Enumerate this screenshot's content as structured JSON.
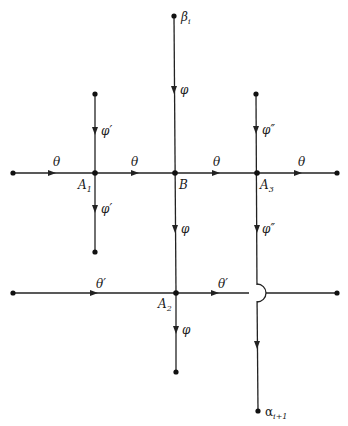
{
  "diagram": {
    "type": "directed-graph",
    "nodes": [
      {
        "id": "beta_i",
        "label": "β",
        "sub": "i",
        "x": 174,
        "y": 16,
        "lx": 181,
        "ly": 20
      },
      {
        "id": "top_A1",
        "label": "",
        "x": 95,
        "y": 94
      },
      {
        "id": "top_A3",
        "label": "",
        "x": 256,
        "y": 94
      },
      {
        "id": "left_row1",
        "label": "",
        "x": 13,
        "y": 173
      },
      {
        "id": "A1",
        "label": "A",
        "sub": "1",
        "x": 95,
        "y": 173,
        "lx": 78,
        "ly": 188
      },
      {
        "id": "B",
        "label": "B",
        "sub": "",
        "x": 175,
        "y": 173,
        "lx": 179,
        "ly": 188
      },
      {
        "id": "A3",
        "label": "A",
        "sub": "3",
        "x": 257,
        "y": 173,
        "lx": 260,
        "ly": 188
      },
      {
        "id": "right_row1",
        "label": "",
        "x": 337,
        "y": 173
      },
      {
        "id": "bottom_A1",
        "label": "",
        "x": 95,
        "y": 252
      },
      {
        "id": "left_row2",
        "label": "",
        "x": 13,
        "y": 293
      },
      {
        "id": "A2",
        "label": "A",
        "sub": "2",
        "x": 176,
        "y": 293,
        "lx": 158,
        "ly": 307
      },
      {
        "id": "right_row2",
        "label": "",
        "x": 337,
        "y": 293
      },
      {
        "id": "bottom_A2",
        "label": "",
        "x": 176,
        "y": 372
      },
      {
        "id": "alpha_i1",
        "label": "α",
        "sub": "i+1",
        "x": 258,
        "y": 411,
        "lx": 265,
        "ly": 415
      }
    ],
    "edges": [
      {
        "from": "beta_i",
        "to": "B",
        "label": "φ",
        "ax": 174,
        "ay": 90,
        "dir": "down"
      },
      {
        "from": "top_A1",
        "to": "A1",
        "label": "φ′",
        "ax": 95,
        "ay": 131,
        "dir": "down"
      },
      {
        "from": "A1",
        "to": "bottom_A1",
        "label": "φ′",
        "ax": 95,
        "ay": 209,
        "dir": "down"
      },
      {
        "from": "top_A3",
        "to": "A3",
        "label": "φ″",
        "ax": 256,
        "ay": 130,
        "dir": "down"
      },
      {
        "from": "A3",
        "to": "alpha_i1",
        "label": "φ″",
        "ax": 257,
        "ay": 229,
        "dir": "down"
      },
      {
        "from": "B",
        "to": "A2",
        "label": "φ",
        "ax": 175,
        "ay": 229,
        "dir": "down"
      },
      {
        "from": "A2",
        "to": "bottom_A2",
        "label": "φ",
        "ax": 176,
        "ay": 330,
        "dir": "down"
      },
      {
        "from": "left_row1",
        "to": "A1",
        "label": "θ",
        "ax": 52,
        "ay": 173,
        "dir": "right"
      },
      {
        "from": "A1",
        "to": "B",
        "label": "θ",
        "ax": 135,
        "ay": 173,
        "dir": "right"
      },
      {
        "from": "B",
        "to": "A3",
        "label": "θ",
        "ax": 216,
        "ay": 173,
        "dir": "right"
      },
      {
        "from": "A3",
        "to": "right_row1",
        "label": "θ",
        "ax": 298,
        "ay": 173,
        "dir": "right"
      },
      {
        "from": "left_row2",
        "to": "A2",
        "label": "θ′",
        "ax": 94,
        "ay": 293,
        "dir": "right"
      },
      {
        "from": "A2",
        "to": "right_row2",
        "label": "θ′",
        "ax": 215,
        "ay": 293,
        "dir": "right",
        "crossing_hop_at_x": 257
      },
      {
        "from": "A3",
        "to": "alpha_i1",
        "label": "",
        "ax": 257,
        "ay": 345,
        "dir": "down"
      }
    ],
    "edge_labels": [
      {
        "text": "φ",
        "x": 180,
        "y": 94
      },
      {
        "text": "φ′",
        "x": 101,
        "y": 135
      },
      {
        "text": "φ″",
        "x": 262,
        "y": 134
      },
      {
        "text": "θ",
        "x": 53,
        "y": 163
      },
      {
        "text": "θ",
        "x": 131,
        "y": 163
      },
      {
        "text": "θ",
        "x": 213,
        "y": 163
      },
      {
        "text": "θ",
        "x": 298,
        "y": 163
      },
      {
        "text": "φ′",
        "x": 101,
        "y": 213
      },
      {
        "text": "φ",
        "x": 181,
        "y": 233
      },
      {
        "text": "φ″",
        "x": 262,
        "y": 233
      },
      {
        "text": "θ′",
        "x": 96,
        "y": 286
      },
      {
        "text": "θ′",
        "x": 218,
        "y": 286
      },
      {
        "text": "φ",
        "x": 182,
        "y": 334
      }
    ]
  }
}
